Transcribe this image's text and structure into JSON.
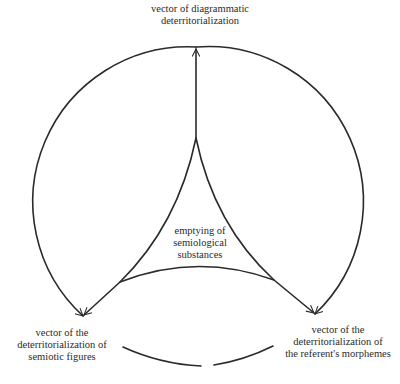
{
  "diagram": {
    "type": "circular vector diagram",
    "line_color": "#2a2a2a",
    "background": "#ffffff",
    "labels": {
      "top": [
        "vector of diagrammatic",
        "deterritorialization"
      ],
      "bottom_left": [
        "vector of the",
        "deterritorialization of",
        "semiotic figures"
      ],
      "bottom_right": [
        "vector of the",
        "deterritorialization of",
        "the referent's morphemes"
      ],
      "center": [
        "emptying of",
        "semiological",
        "substances"
      ]
    },
    "nodes": [
      {
        "id": "center",
        "label": "emptying of semiological substances"
      },
      {
        "id": "top",
        "label": "vector of diagrammatic deterritorialization"
      },
      {
        "id": "bottom_left",
        "label": "vector of the deterritorialization of semiotic figures"
      },
      {
        "id": "bottom_right",
        "label": "vector of the deterritorialization of the referent's morphemes"
      }
    ],
    "edges": [
      {
        "from": "center",
        "to": "top",
        "style": "arrow"
      },
      {
        "from": "center",
        "to": "bottom_left",
        "style": "arrow"
      },
      {
        "from": "center",
        "to": "bottom_right",
        "style": "arrow"
      },
      {
        "from": "top",
        "to": "bottom_left",
        "style": "outer-arc-arrow"
      },
      {
        "from": "top",
        "to": "bottom_right",
        "style": "outer-arc-arrow"
      },
      {
        "from": "bottom_left",
        "to": "bottom_right",
        "style": "broken-arc"
      }
    ]
  }
}
